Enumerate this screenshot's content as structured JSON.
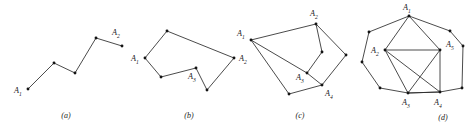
{
  "figure": {
    "width": 471,
    "height": 130,
    "background": "#ffffff",
    "stroke_color": "#2b2b2b",
    "vertex_color": "#141414",
    "label_color": "#1a1a1a"
  },
  "panels": [
    {
      "id": "a",
      "caption": "(a)",
      "caption_pos": {
        "x": 66,
        "y": 118
      },
      "type": "polyline",
      "vertices": [
        {
          "x": 28,
          "y": 89
        },
        {
          "x": 54,
          "y": 63
        },
        {
          "x": 75,
          "y": 73
        },
        {
          "x": 96,
          "y": 38
        },
        {
          "x": 122,
          "y": 46
        }
      ],
      "edges": [
        [
          0,
          1
        ],
        [
          1,
          2
        ],
        [
          2,
          3
        ],
        [
          3,
          4
        ]
      ],
      "labels": [
        {
          "text": "A",
          "sub": "1",
          "x": 14,
          "y": 93,
          "vertex": 0
        },
        {
          "text": "A",
          "sub": "2",
          "x": 112,
          "y": 35,
          "vertex": 4
        }
      ]
    },
    {
      "id": "b",
      "caption": "(b)",
      "caption_pos": {
        "x": 189,
        "y": 118
      },
      "type": "polygon",
      "vertices": [
        {
          "x": 145,
          "y": 58
        },
        {
          "x": 167,
          "y": 31
        },
        {
          "x": 234,
          "y": 58
        },
        {
          "x": 207,
          "y": 90
        },
        {
          "x": 196,
          "y": 68
        },
        {
          "x": 161,
          "y": 77
        }
      ],
      "edges": [
        [
          0,
          1
        ],
        [
          1,
          2
        ],
        [
          2,
          3
        ],
        [
          3,
          4
        ],
        [
          4,
          5
        ],
        [
          5,
          0
        ]
      ],
      "labels": [
        {
          "text": "A",
          "sub": "1",
          "x": 131,
          "y": 61,
          "vertex": 0
        },
        {
          "text": "A",
          "sub": "2",
          "x": 239,
          "y": 61,
          "vertex": 2
        },
        {
          "text": "A",
          "sub": "3",
          "x": 188,
          "y": 79,
          "vertex": 4
        }
      ]
    },
    {
      "id": "c",
      "caption": "(c)",
      "caption_pos": {
        "x": 300,
        "y": 118
      },
      "type": "polygon-with-diagonals",
      "vertices": [
        {
          "x": 251,
          "y": 40
        },
        {
          "x": 316,
          "y": 24
        },
        {
          "x": 322,
          "y": 52
        },
        {
          "x": 307,
          "y": 73
        },
        {
          "x": 322,
          "y": 85
        },
        {
          "x": 289,
          "y": 94
        },
        {
          "x": 346,
          "y": 55
        }
      ],
      "edges": [
        [
          0,
          1
        ],
        [
          1,
          2
        ],
        [
          2,
          3
        ],
        [
          3,
          4
        ],
        [
          4,
          5
        ],
        [
          5,
          0
        ],
        [
          0,
          3
        ],
        [
          1,
          6
        ],
        [
          6,
          4
        ]
      ],
      "labels": [
        {
          "text": "A",
          "sub": "1",
          "x": 237,
          "y": 36,
          "vertex": 0
        },
        {
          "text": "A",
          "sub": "2",
          "x": 310,
          "y": 16,
          "vertex": 1
        },
        {
          "text": "A",
          "sub": "3",
          "x": 296,
          "y": 80,
          "vertex": 3
        },
        {
          "text": "A",
          "sub": "4",
          "x": 325,
          "y": 96,
          "vertex": 4
        }
      ]
    },
    {
      "id": "d",
      "caption": "(d)",
      "caption_pos": {
        "x": 443,
        "y": 120
      },
      "type": "decagon-with-inner-pentagon",
      "vertices": [
        {
          "x": 409,
          "y": 16
        },
        {
          "x": 385,
          "y": 50
        },
        {
          "x": 408,
          "y": 93
        },
        {
          "x": 440,
          "y": 92
        },
        {
          "x": 440,
          "y": 50
        },
        {
          "x": 369,
          "y": 32
        },
        {
          "x": 362,
          "y": 62
        },
        {
          "x": 380,
          "y": 88
        },
        {
          "x": 462,
          "y": 88
        },
        {
          "x": 463,
          "y": 46
        },
        {
          "x": 450,
          "y": 31
        }
      ],
      "edges": [
        [
          0,
          5
        ],
        [
          5,
          6
        ],
        [
          6,
          7
        ],
        [
          7,
          2
        ],
        [
          2,
          3
        ],
        [
          3,
          8
        ],
        [
          8,
          9
        ],
        [
          9,
          10
        ],
        [
          10,
          0
        ],
        [
          0,
          1
        ],
        [
          1,
          2
        ],
        [
          2,
          3
        ],
        [
          3,
          4
        ],
        [
          4,
          0
        ],
        [
          1,
          4
        ],
        [
          1,
          3
        ],
        [
          2,
          4
        ]
      ],
      "labels": [
        {
          "text": "A",
          "sub": "1",
          "x": 403,
          "y": 10,
          "vertex": 0
        },
        {
          "text": "A",
          "sub": "2",
          "x": 371,
          "y": 53,
          "vertex": 1
        },
        {
          "text": "A",
          "sub": "3",
          "x": 402,
          "y": 105,
          "vertex": 2
        },
        {
          "text": "A",
          "sub": "4",
          "x": 434,
          "y": 105,
          "vertex": 3
        },
        {
          "text": "A",
          "sub": "5",
          "x": 446,
          "y": 47,
          "vertex": 4
        }
      ]
    }
  ]
}
